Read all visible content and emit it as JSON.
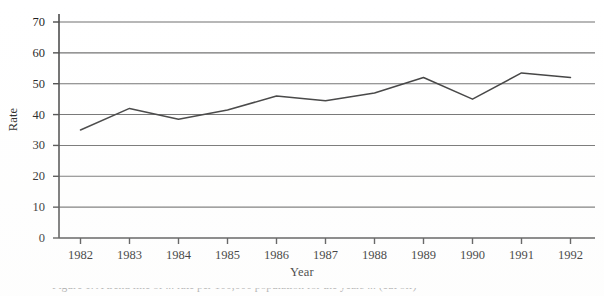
{
  "figure": {
    "background_color": "#ffffff",
    "axis_color": "#4a4a4a",
    "gridline_color": "#6e6e6e",
    "line_color": "#3c3c3c",
    "text_color": "#1c1c1c"
  },
  "caption": {
    "text": "Figure 1. A trend line of ... rate per 100,000 population for the years ... (cut off)"
  },
  "chart_data": {
    "type": "line",
    "title": "",
    "xlabel": "Year",
    "ylabel": "Rate",
    "categories": [
      "1982",
      "1983",
      "1984",
      "1985",
      "1986",
      "1987",
      "1988",
      "1989",
      "1990",
      "1991",
      "1992"
    ],
    "x": [
      1982,
      1983,
      1984,
      1985,
      1986,
      1987,
      1988,
      1989,
      1990,
      1991,
      1992
    ],
    "values": [
      35,
      42,
      38.5,
      41.5,
      46,
      44.5,
      47,
      52,
      45,
      53.5,
      52
    ],
    "series": [
      {
        "name": "Rate",
        "values": [
          35,
          42,
          38.5,
          41.5,
          46,
          44.5,
          47,
          52,
          45,
          53.5,
          52
        ]
      }
    ],
    "ylim": [
      0,
      70
    ],
    "yticks": [
      0,
      10,
      20,
      30,
      40,
      50,
      60,
      70
    ],
    "ytick_labels": [
      "0",
      "10",
      "20",
      "30",
      "40",
      "50",
      "60",
      "70"
    ],
    "xtick_labels": [
      "1982",
      "1983",
      "1984",
      "1985",
      "1986",
      "1987",
      "1988",
      "1989",
      "1990",
      "1991",
      "1992"
    ],
    "grid": true,
    "grid_axis": "y",
    "legend": false,
    "legend_position": "none",
    "markers": false
  }
}
